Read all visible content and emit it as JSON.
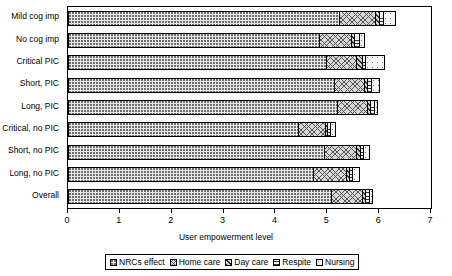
{
  "chart_data": {
    "type": "bar",
    "orientation": "horizontal",
    "stacked": true,
    "title": "",
    "xlabel": "User empowerment level",
    "ylabel": "",
    "xlim": [
      0,
      7
    ],
    "xticks": [
      0,
      1,
      2,
      3,
      4,
      5,
      6,
      7
    ],
    "xticklabels": [
      "0",
      "1",
      "2",
      "3",
      "4",
      "5",
      "6",
      "7"
    ],
    "grid": false,
    "legend_position": "bottom",
    "categories": [
      "Mild cog imp",
      "No cog imp",
      "Critical PIC",
      "Short, PIC",
      "Long, PIC",
      "Critical, no PIC",
      "Short, no PIC",
      "Long, no PIC",
      "Overall"
    ],
    "series": [
      {
        "name": "NRCs effect",
        "values": [
          5.25,
          4.85,
          5.0,
          5.15,
          5.2,
          4.45,
          4.95,
          4.75,
          5.1
        ]
      },
      {
        "name": "Home care",
        "values": [
          0.7,
          0.65,
          0.6,
          0.6,
          0.6,
          0.55,
          0.65,
          0.65,
          0.6
        ]
      },
      {
        "name": "Day care",
        "values": [
          0.1,
          0.08,
          0.12,
          0.08,
          0.08,
          0.06,
          0.08,
          0.08,
          0.08
        ]
      },
      {
        "name": "Respite",
        "values": [
          0.1,
          0.1,
          0.08,
          0.1,
          0.1,
          0.07,
          0.08,
          0.08,
          0.1
        ]
      },
      {
        "name": "Nursing",
        "values": [
          0.25,
          0.12,
          0.4,
          0.17,
          0.07,
          0.12,
          0.14,
          0.14,
          0.07
        ]
      }
    ],
    "totals": [
      6.4,
      5.8,
      6.2,
      6.1,
      6.05,
      5.25,
      5.9,
      5.7,
      5.95
    ]
  },
  "legend": {
    "items": [
      {
        "label": "NRCs effect",
        "pattern": "dotted-fine"
      },
      {
        "label": "Home care",
        "pattern": "cross-hatch"
      },
      {
        "label": "Day care",
        "pattern": "diagonal-hatch"
      },
      {
        "label": "Respite",
        "pattern": "horizontal-lines"
      },
      {
        "label": "Nursing",
        "pattern": "dotted-sparse"
      }
    ]
  }
}
